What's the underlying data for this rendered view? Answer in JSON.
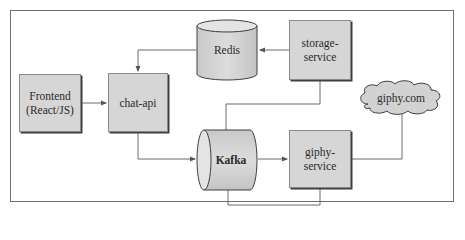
{
  "diagram": {
    "type": "architecture",
    "nodes": [
      {
        "id": "frontend",
        "label": "Frontend\n(React/JS)",
        "shape": "box"
      },
      {
        "id": "chat_api",
        "label": "chat-api",
        "shape": "box"
      },
      {
        "id": "redis",
        "label": "Redis",
        "shape": "cylinder-vertical"
      },
      {
        "id": "storage_service",
        "label": "storage-\nservice",
        "shape": "box"
      },
      {
        "id": "kafka",
        "label": "Kafka",
        "shape": "cylinder-horizontal"
      },
      {
        "id": "giphy_service",
        "label": "giphy-\nservice",
        "shape": "box"
      },
      {
        "id": "giphy_com",
        "label": "giphy.com",
        "shape": "cloud"
      }
    ],
    "edges": [
      {
        "from": "frontend",
        "to": "chat_api",
        "arrow": true
      },
      {
        "from": "redis",
        "to": "chat_api",
        "arrow": true
      },
      {
        "from": "chat_api",
        "to": "kafka",
        "arrow": true
      },
      {
        "from": "storage_service",
        "to": "redis",
        "arrow": true
      },
      {
        "from": "kafka",
        "to": "storage_service",
        "arrow": false
      },
      {
        "from": "kafka",
        "to": "giphy_service",
        "arrow": true
      },
      {
        "from": "giphy_service",
        "to": "kafka",
        "arrow": false
      },
      {
        "from": "giphy_service",
        "to": "giphy_com",
        "arrow": false
      }
    ],
    "colors": {
      "node_fill": "#d6d6d6",
      "node_border": "#8a8a8a",
      "node_shadow": "#3e3e3e",
      "line": "#6a6a6a",
      "frame": "#6f6f6f"
    }
  }
}
